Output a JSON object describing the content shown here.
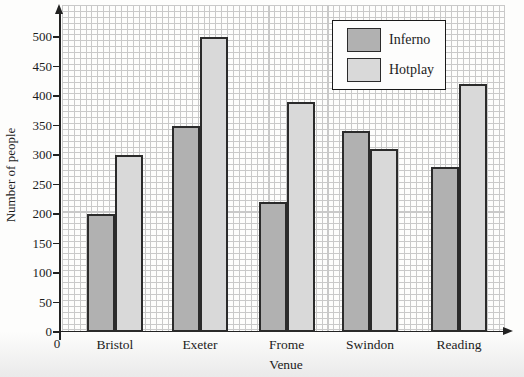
{
  "chart_data": {
    "type": "bar",
    "title": "",
    "categories": [
      "Bristol",
      "Exeter",
      "Frome",
      "Swindon",
      "Reading"
    ],
    "series": [
      {
        "name": "Inferno",
        "color": "#b1b1b1",
        "values": [
          200,
          350,
          220,
          340,
          280
        ]
      },
      {
        "name": "Hotplay",
        "color": "#d9d9d9",
        "values": [
          300,
          500,
          390,
          310,
          420
        ]
      }
    ],
    "xlabel": "Venue",
    "ylabel": "Number of people",
    "ylim": [
      0,
      500
    ],
    "ytick_step": 50,
    "y_tick_labels": [
      "0",
      "50",
      "100",
      "150",
      "200",
      "250",
      "300",
      "350",
      "400",
      "450",
      "500"
    ],
    "x_origin_label": "0",
    "grid": {
      "style": "graph-paper",
      "minor_unit": 10,
      "on": true
    },
    "legend": {
      "position": "top-right-inside",
      "entries": [
        "Inferno",
        "Hotplay"
      ]
    },
    "colors": {
      "axis": "#222222",
      "grid_line": "#c9c9c9",
      "background": "#fdfdfc"
    }
  }
}
